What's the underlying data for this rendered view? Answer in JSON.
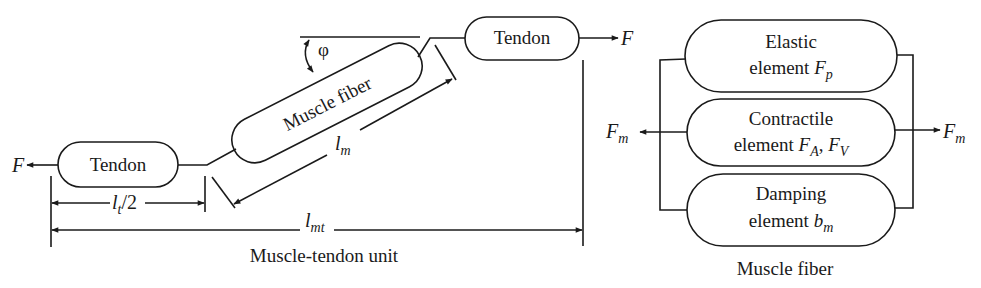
{
  "left_diagram": {
    "caption": "Muscle-tendon unit",
    "tendon_left": {
      "label": "Tendon"
    },
    "tendon_right": {
      "label": "Tendon"
    },
    "muscle_fiber": {
      "label": "Muscle fiber"
    },
    "force_left": "F",
    "force_right": "F",
    "pennation_angle": "φ",
    "dim_muscle_length": {
      "base": "l",
      "sub": "m"
    },
    "dim_tendon_half": {
      "base": "l",
      "sub": "t",
      "suffix": "/2"
    },
    "dim_total": {
      "base": "l",
      "sub": "mt"
    }
  },
  "right_diagram": {
    "caption": "Muscle fiber",
    "force_left": {
      "base": "F",
      "sub": "m"
    },
    "force_right": {
      "base": "F",
      "sub": "m"
    },
    "elements": [
      {
        "line1": "Elastic",
        "line2": "element ",
        "symbol": "F",
        "sub": "p"
      },
      {
        "line1": "Contractile",
        "line2": "element ",
        "symbol": "F",
        "sub": "A",
        "sep": ", ",
        "symbol2": "F",
        "sub2": "V"
      },
      {
        "line1": "Damping",
        "line2": "element ",
        "symbol": "b",
        "sub": "m"
      }
    ]
  },
  "colors": {
    "stroke": "#1a1a1a",
    "background": "#ffffff"
  }
}
